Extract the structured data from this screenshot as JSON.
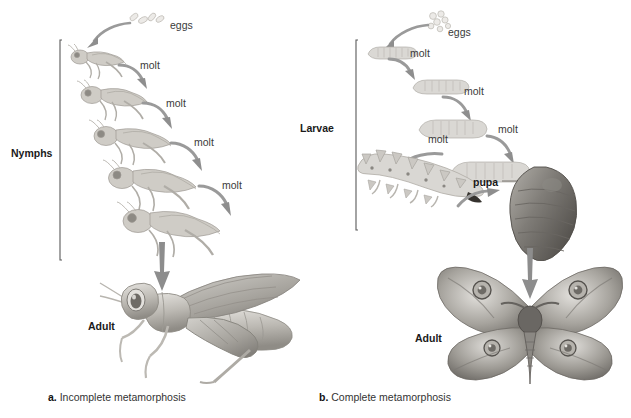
{
  "figure": {
    "background_color": "#ffffff",
    "width": 631,
    "height": 418
  },
  "panels": [
    {
      "id": "a",
      "caption_marker": "a.",
      "caption_text": "Incomplete metamorphosis",
      "stage_bracket_label": "Nymphs",
      "eggs_label": "eggs",
      "adult_label": "Adult",
      "adult_organism": "grasshopper",
      "molt_labels": [
        "molt",
        "molt",
        "molt",
        "molt"
      ],
      "stages": [
        {
          "name": "eggs",
          "organism": "egg-cluster"
        },
        {
          "name": "nymph-instar-1",
          "organism": "grasshopper-nymph"
        },
        {
          "name": "nymph-instar-2",
          "organism": "grasshopper-nymph"
        },
        {
          "name": "nymph-instar-3",
          "organism": "grasshopper-nymph"
        },
        {
          "name": "nymph-instar-4",
          "organism": "grasshopper-nymph"
        },
        {
          "name": "nymph-instar-5",
          "organism": "grasshopper-nymph"
        },
        {
          "name": "adult",
          "organism": "adult-grasshopper"
        }
      ]
    },
    {
      "id": "b",
      "caption_marker": "b.",
      "caption_text": "Complete metamorphosis",
      "stage_bracket_label": "Larvae",
      "eggs_label": "eggs",
      "adult_label": "Adult",
      "pupa_label": "pupa",
      "adult_organism": "moth",
      "molt_labels": [
        "molt",
        "molt",
        "molt",
        "molt"
      ],
      "stages": [
        {
          "name": "eggs",
          "organism": "egg-cluster"
        },
        {
          "name": "larva-instar-1",
          "organism": "caterpillar"
        },
        {
          "name": "larva-instar-2",
          "organism": "caterpillar"
        },
        {
          "name": "larva-instar-3",
          "organism": "caterpillar"
        },
        {
          "name": "larva-instar-4",
          "organism": "caterpillar"
        },
        {
          "name": "larva-instar-5",
          "organism": "spiny-caterpillar"
        },
        {
          "name": "pupa",
          "organism": "cocoon"
        },
        {
          "name": "adult",
          "organism": "adult-moth"
        }
      ]
    }
  ],
  "colors": {
    "ink": "#231f20",
    "arrow": "#8a8a8a",
    "bracket": "#555555",
    "art_light": "#d8d6d2",
    "art_mid": "#a9a69f",
    "art_dark": "#6d6a64"
  }
}
